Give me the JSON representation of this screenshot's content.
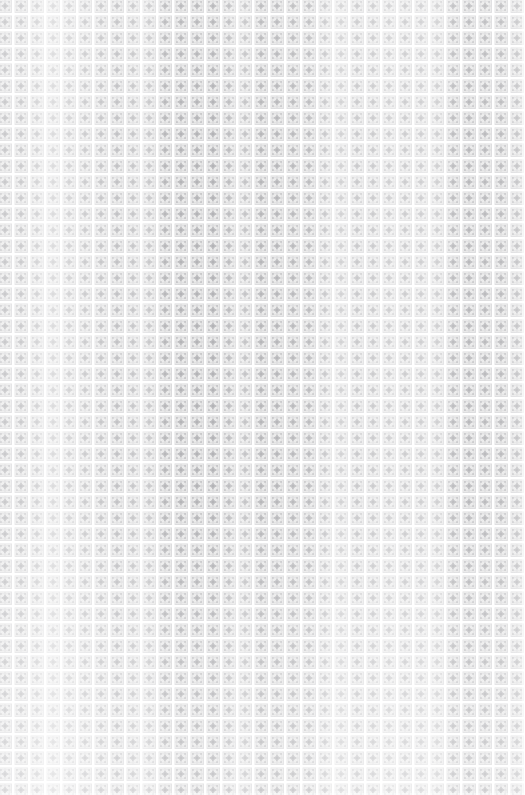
{
  "image": {
    "kind": "seamless-decorative-pattern",
    "subject": "ornamental tiled wallpaper / textile swatch",
    "width_px": 525,
    "height_px": 795,
    "description": "Dense edge-to-edge grid of small square ornamental tiles in pale grey on near-white, each tile framed by a thin square border and centred on a four-pointed star or diamond rosette, with small dot accents in the tile corners. Thin white seams separate the tiles. The overall tone is very light and slightly faded, with soft vertical bands of extra brightness."
  },
  "palette": {
    "background": "#ffffff",
    "paper": "#fbfbfb",
    "motif_light": "#e8e8e8",
    "motif_mid": "#d6d6d8",
    "motif_dark": "#bdbdc0",
    "motif_accent": "#a9a9ad",
    "seam": "#ffffff"
  },
  "tiling": {
    "tile_width_px": 16,
    "tile_height_px": 16,
    "columns": 33,
    "rows": 50,
    "seam_width_px": 2,
    "origin_offset_x_px": -3,
    "origin_offset_y_px": -2,
    "repeat": "both"
  },
  "motif": {
    "name": "square-frame-star-rosette",
    "elements": [
      "outer square frame",
      "inner square frame",
      "central four-pointed star",
      "central diamond core",
      "four corner dots",
      "four edge midpoint dashes"
    ],
    "symmetry": "4-fold rotational, mirrored on both axes"
  },
  "shading": {
    "vertical_band_period_px": 96,
    "band_highlight_opacity": 0.3,
    "edge_fade": "slight lightening toward the left edge and the bottom edge"
  },
  "caption": "Seamless pale grey ornamental tile pattern"
}
